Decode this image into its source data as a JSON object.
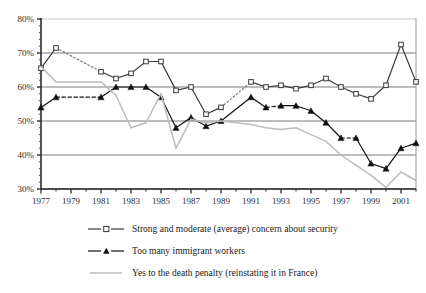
{
  "chart_data": {
    "type": "line",
    "title": "",
    "subtitle": "",
    "xlabel": "",
    "ylabel": "",
    "xlim": [
      1977,
      2002
    ],
    "ylim": [
      30,
      80
    ],
    "ytick_labels": [
      "80%",
      "70%",
      "60%",
      "50%",
      "40%",
      "30%"
    ],
    "yticks": [
      80,
      70,
      60,
      50,
      40,
      30
    ],
    "xtick_labels": [
      "1977",
      "1979",
      "1981",
      "1983",
      "1985",
      "1987",
      "1989",
      "1991",
      "1993",
      "1995",
      "1997",
      "1999",
      "2001"
    ],
    "xticks": [
      1977,
      1979,
      1981,
      1983,
      1985,
      1987,
      1989,
      1991,
      1993,
      1995,
      1997,
      1999,
      2001
    ],
    "grid": "horizontal",
    "legend_position": "bottom",
    "series": [
      {
        "name": "Strong and moderate (average) concern about security",
        "color": "#3a3a3a",
        "marker": "open-square",
        "x": [
          1977,
          1978,
          1981,
          1982,
          1983,
          1984,
          1985,
          1986,
          1987,
          1988,
          1989,
          1991,
          1992,
          1993,
          1994,
          1995,
          1996,
          1997,
          1998,
          1999,
          2000,
          2001,
          2002
        ],
        "values": [
          65.5,
          71.5,
          64.5,
          62.5,
          64,
          67.5,
          67.5,
          59,
          60,
          52,
          54,
          61.5,
          60,
          60.5,
          59.5,
          60.5,
          62.5,
          60,
          58,
          56.5,
          60.5,
          72.5,
          61.5
        ],
        "dashed_gaps": [
          [
            1978,
            1981
          ],
          [
            1989,
            1991
          ]
        ]
      },
      {
        "name": "Too many immigrant workers",
        "color": "#111111",
        "marker": "filled-triangle",
        "x": [
          1977,
          1978,
          1981,
          1982,
          1983,
          1984,
          1985,
          1986,
          1987,
          1988,
          1989,
          1991,
          1992,
          1993,
          1994,
          1995,
          1996,
          1997,
          1998,
          1999,
          2000,
          2001,
          2002
        ],
        "values": [
          54,
          57,
          57,
          60,
          60,
          60,
          57,
          48,
          51,
          48.5,
          50,
          57,
          54,
          54.5,
          54.5,
          53,
          49.5,
          45,
          45,
          37.5,
          36,
          42,
          43.5
        ],
        "dashed_gaps": [
          [
            1978,
            1981
          ],
          [
            1992,
            1993
          ],
          [
            1997,
            1998
          ]
        ]
      },
      {
        "name": "Yes to the death penalty (reinstating it in France)",
        "color": "#bdbdbd",
        "marker": "none",
        "x": [
          1977,
          1978,
          1981,
          1982,
          1983,
          1984,
          1985,
          1986,
          1987,
          1988,
          1989,
          1991,
          1992,
          1993,
          1994,
          1995,
          1996,
          1997,
          1998,
          1999,
          2000,
          2001,
          2002
        ],
        "values": [
          66,
          61.5,
          61.5,
          57.5,
          48,
          49.5,
          58,
          42,
          50.5,
          49.5,
          50,
          49,
          48,
          47.5,
          48,
          46,
          44,
          40,
          37,
          34,
          30.5,
          35,
          32.5
        ],
        "dashed_gaps": [
          [
            1995,
            1998
          ]
        ]
      }
    ]
  },
  "legend": {
    "items": [
      {
        "label": "Strong and moderate (average) concern about security",
        "marker": "open-square"
      },
      {
        "label": "Too many immigrant workers",
        "marker": "filled-triangle"
      },
      {
        "label": "Yes to the death penalty (reinstating it in France)",
        "marker": "line"
      }
    ]
  },
  "colors": {
    "series1": "#3a3a3a",
    "series2": "#111111",
    "series3": "#bdbdbd",
    "grid": "#7d7d7d",
    "axis": "#2b2b2b",
    "background": "#ffffff"
  }
}
